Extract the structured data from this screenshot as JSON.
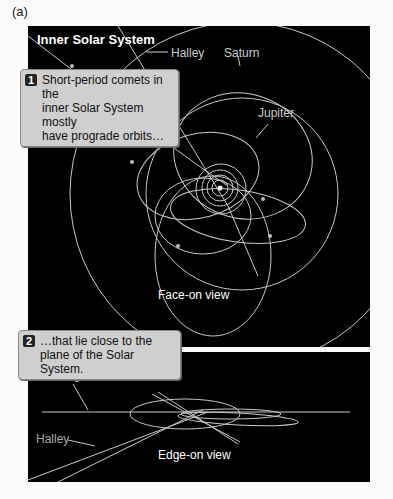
{
  "figure_label": "(a)",
  "top_panel": {
    "title": "Inner Solar System",
    "labels": {
      "halley": "Halley",
      "saturn": "Saturn",
      "jupiter": "Jupiter",
      "view": "Face-on view"
    },
    "callout": {
      "number": "1",
      "text_line1": "Short-period comets in the",
      "text_line2": "inner Solar System mostly",
      "text_line3": "have prograde orbits…"
    }
  },
  "bottom_panel": {
    "labels": {
      "plane_line1": "Plane of",
      "plane_line2": "Solar System",
      "halley": "Halley",
      "view": "Edge-on view"
    },
    "callout": {
      "number": "2",
      "text_line1": "…that lie close to the",
      "text_line2": "plane of the Solar System."
    }
  },
  "colors": {
    "background": "#000000",
    "orbit": "#c8c8c8",
    "callout_bg": "#cfcfcf"
  }
}
